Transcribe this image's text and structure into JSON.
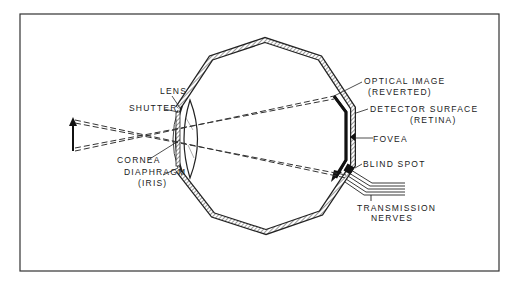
{
  "diagram": {
    "labels": {
      "lens": "LENS",
      "shutter": "SHUTTER",
      "cornea": "CORNEA",
      "diaphragm": "DIAPHRAGM",
      "iris": "(IRIS)",
      "optical_image": "OPTICAL IMAGE",
      "reverted": "(REVERTED)",
      "detector_surface": "DETECTOR SURFACE",
      "retina": "(RETINA)",
      "fovea": "FOVEA",
      "blind_spot": "BLIND SPOT",
      "transmission": "TRANSMISSION",
      "nerves": "NERVES"
    },
    "colors": {
      "ink": "#1a1a1a",
      "background": "#ffffff"
    }
  }
}
